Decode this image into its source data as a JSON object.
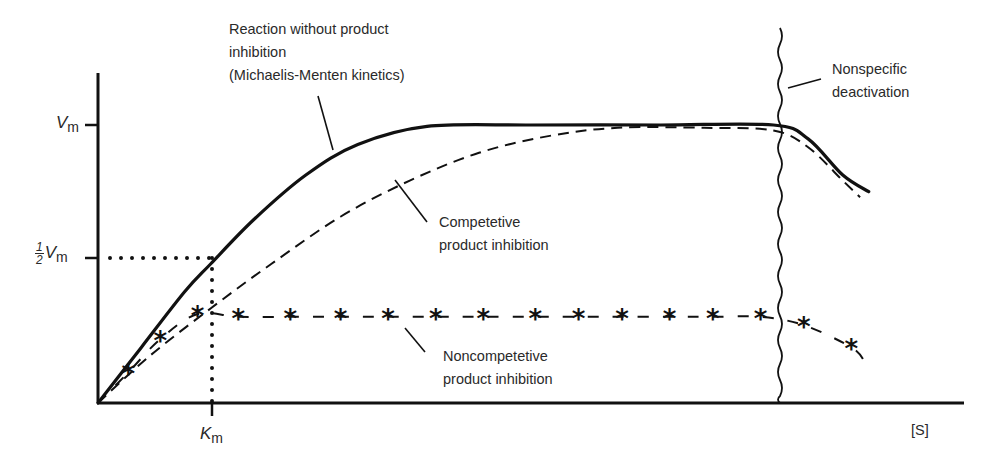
{
  "chart_data": {
    "type": "line",
    "title": "",
    "xlabel": "[S]",
    "ylabel": "",
    "xlim": [
      0,
      1
    ],
    "ylim": [
      0,
      1
    ],
    "grid": false,
    "y_ticks": [
      {
        "label": "V_m",
        "value": 1.0
      },
      {
        "label": "1/2 V_m",
        "value": 0.5
      }
    ],
    "x_ticks": [
      {
        "label": "K_m",
        "value": 0.13
      }
    ],
    "series": [
      {
        "name": "Reaction without product inhibition (Michaelis-Menten kinetics)",
        "style": "solid-thick",
        "x": [
          0.0,
          0.05,
          0.1,
          0.13,
          0.18,
          0.24,
          0.3,
          0.38,
          0.5,
          0.65,
          0.78,
          0.82,
          0.86,
          0.89
        ],
        "y": [
          0.0,
          0.2,
          0.4,
          0.5,
          0.66,
          0.82,
          0.93,
          0.995,
          1.0,
          1.0,
          1.0,
          0.95,
          0.82,
          0.76
        ]
      },
      {
        "name": "Competetive product inhibition",
        "style": "dashed",
        "x": [
          0.0,
          0.06,
          0.13,
          0.2,
          0.28,
          0.36,
          0.44,
          0.52,
          0.6,
          0.7,
          0.78,
          0.82,
          0.86,
          0.88
        ],
        "y": [
          0.0,
          0.17,
          0.34,
          0.5,
          0.67,
          0.8,
          0.9,
          0.96,
          0.99,
          0.99,
          0.98,
          0.92,
          0.8,
          0.74
        ]
      },
      {
        "name": "Noncompetetive product inhibition",
        "style": "dashed-asterisk",
        "x": [
          0.0,
          0.035,
          0.072,
          0.115,
          0.162,
          0.222,
          0.28,
          0.335,
          0.39,
          0.445,
          0.505,
          0.555,
          0.605,
          0.66,
          0.71,
          0.765,
          0.815,
          0.87,
          0.885
        ],
        "y": [
          0.0,
          0.11,
          0.23,
          0.32,
          0.31,
          0.31,
          0.31,
          0.31,
          0.31,
          0.31,
          0.31,
          0.31,
          0.31,
          0.31,
          0.31,
          0.31,
          0.28,
          0.2,
          0.15
        ]
      }
    ],
    "annotations": [
      {
        "text": "Reaction without product inhibition (Michaelis-Menten kinetics)",
        "target": "solid curve"
      },
      {
        "text": "Competetive product inhibition",
        "target": "dashed curve"
      },
      {
        "text": "Noncompetetive product inhibition",
        "target": "asterisk curve"
      },
      {
        "text": "Nonspecific deactivation",
        "target": "wavy vertical line at high [S]"
      },
      {
        "text": "K_m",
        "target": "x at half V_m (dotted guide lines)"
      }
    ]
  },
  "labels": {
    "mm_line1": "Reaction without product",
    "mm_line2": "inhibition",
    "mm_line3": "(Michaelis-Menten kinetics)",
    "comp_line1": "Competetive",
    "comp_line2": "product inhibition",
    "noncomp_line1": "Noncompetetive",
    "noncomp_line2": "product inhibition",
    "deact_line1": "Nonspecific",
    "deact_line2": "deactivation",
    "x_axis": "[S]",
    "vm_main": "V",
    "vm_sub": "m",
    "half_num": "1",
    "half_den": "2",
    "km_main": "K",
    "km_sub": "m"
  },
  "colors": {
    "ink": "#111111",
    "text": "#2a2a2a",
    "background": "#ffffff"
  }
}
